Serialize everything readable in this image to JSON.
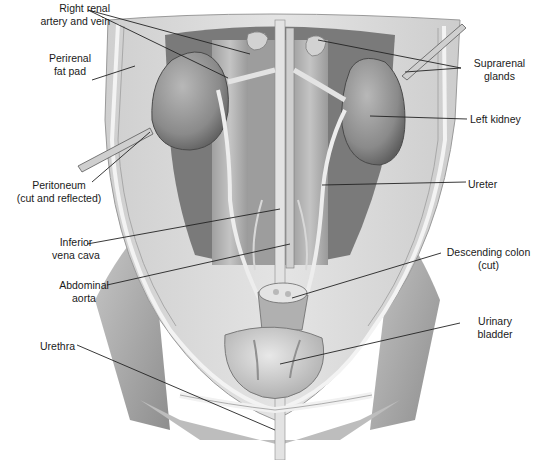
{
  "figure": {
    "colors": {
      "background": "#ffffff",
      "label_text": "#1a1a1a",
      "leader_line": "#222222",
      "tissue_light": "#d9d9d9",
      "tissue_mid": "#b5b5b5",
      "tissue_dark": "#6e6e6e",
      "kidney": "#8f8f8f",
      "vessel": "#e6e6e6"
    }
  },
  "labels": [
    {
      "id": "right-renal-artery-vein",
      "lines": [
        "Right renal",
        "artery and vein"
      ],
      "x": 2,
      "y": 2,
      "align": "right",
      "w": 108
    },
    {
      "id": "perirenal-fat-pad",
      "lines": [
        "Perirenal",
        "fat pad"
      ],
      "x": 30,
      "y": 52,
      "align": "center",
      "w": 80
    },
    {
      "id": "peritoneum",
      "lines": [
        "Peritoneum",
        "(cut and reflected)"
      ],
      "x": 4,
      "y": 179,
      "align": "center",
      "w": 110
    },
    {
      "id": "inferior-vena-cava",
      "lines": [
        "Inferior",
        "vena cava"
      ],
      "x": 36,
      "y": 236,
      "align": "center",
      "w": 80
    },
    {
      "id": "abdominal-aorta",
      "lines": [
        "Abdominal",
        "aorta"
      ],
      "x": 44,
      "y": 279,
      "align": "center",
      "w": 80
    },
    {
      "id": "urethra",
      "lines": [
        "Urethra"
      ],
      "x": 40,
      "y": 340,
      "align": "left",
      "w": 60
    },
    {
      "id": "suprarenal-glands",
      "lines": [
        "Suprarenal",
        "glands"
      ],
      "x": 462,
      "y": 57,
      "align": "center",
      "w": 75
    },
    {
      "id": "left-kidney",
      "lines": [
        "Left kidney"
      ],
      "x": 470,
      "y": 113,
      "align": "left",
      "w": 67
    },
    {
      "id": "ureter",
      "lines": [
        "Ureter"
      ],
      "x": 468,
      "y": 178,
      "align": "left",
      "w": 50
    },
    {
      "id": "descending-colon",
      "lines": [
        "Descending colon",
        "(cut)"
      ],
      "x": 440,
      "y": 246,
      "align": "center",
      "w": 97
    },
    {
      "id": "urinary-bladder",
      "lines": [
        "Urinary",
        "bladder"
      ],
      "x": 460,
      "y": 315,
      "align": "center",
      "w": 70
    }
  ],
  "leaders": [
    {
      "id": "right-renal-artery-vein",
      "points": [
        [
          88,
          10
        ],
        [
          228,
          78
        ]
      ]
    },
    {
      "id": "right-renal-artery-vein-2",
      "points": [
        [
          88,
          10
        ],
        [
          250,
          54
        ]
      ]
    },
    {
      "id": "perirenal-fat-pad",
      "points": [
        [
          92,
          80
        ],
        [
          135,
          66
        ]
      ]
    },
    {
      "id": "peritoneum",
      "points": [
        [
          92,
          182
        ],
        [
          150,
          132
        ]
      ]
    },
    {
      "id": "inferior-vena-cava",
      "points": [
        [
          87,
          244
        ],
        [
          280,
          209
        ]
      ]
    },
    {
      "id": "abdominal-aorta",
      "points": [
        [
          107,
          285
        ],
        [
          290,
          244
        ]
      ]
    },
    {
      "id": "urethra",
      "points": [
        [
          77,
          345
        ],
        [
          275,
          430
        ]
      ]
    },
    {
      "id": "suprarenal-glands",
      "points": [
        [
          461,
          68
        ],
        [
          318,
          40
        ]
      ]
    },
    {
      "id": "suprarenal-glands-2",
      "points": [
        [
          461,
          68
        ],
        [
          405,
          72
        ]
      ]
    },
    {
      "id": "left-kidney",
      "points": [
        [
          467,
          119
        ],
        [
          370,
          116
        ]
      ]
    },
    {
      "id": "ureter",
      "points": [
        [
          466,
          182
        ],
        [
          322,
          185
        ]
      ]
    },
    {
      "id": "descending-colon",
      "points": [
        [
          441,
          253
        ],
        [
          292,
          298
        ]
      ]
    },
    {
      "id": "urinary-bladder",
      "points": [
        [
          460,
          323
        ],
        [
          280,
          364
        ]
      ]
    }
  ]
}
